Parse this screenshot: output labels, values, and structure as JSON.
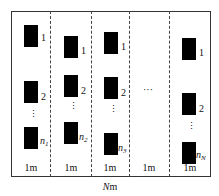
{
  "diagram": {
    "type": "array-layout",
    "columns": [
      {
        "index": 1,
        "labels": [
          "1",
          "2",
          "n",
          "1"
        ],
        "width_label": "1m"
      },
      {
        "index": 2,
        "labels": [
          "1",
          "2",
          "n",
          "2"
        ],
        "width_label": "1m"
      },
      {
        "index": 3,
        "labels": [
          "1",
          "2",
          "n",
          "3"
        ],
        "width_label": "1m"
      },
      {
        "index": 4,
        "labels": [],
        "ellipsis": "···",
        "width_label": "1m"
      },
      {
        "index": 5,
        "labels": [
          "1",
          "2",
          "n",
          "N"
        ],
        "width_label": "1m"
      }
    ],
    "vertical_ellipsis": "⋮",
    "total_width_label": {
      "italic": "N",
      "unit": "m"
    },
    "colors": {
      "block": "#000000",
      "frame": "#333333",
      "background": "#ffffff"
    }
  }
}
